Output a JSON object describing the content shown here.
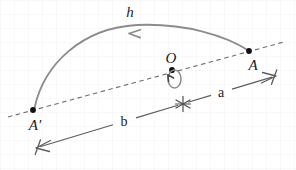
{
  "figure": {
    "type": "geometry-diagram",
    "title": "",
    "background_color": "#ffffff",
    "grid": {
      "visible": true,
      "color": "#f2f3f5",
      "spacing_px": 14
    },
    "colors": {
      "curve": "#8a8a8a",
      "dashed_axis": "#6e6e6e",
      "measure_line": "#5d5d5d",
      "point": "#111111",
      "label": "#1c1c1c",
      "loop_arrow": "#7f7f7f"
    },
    "labels": {
      "h": "h",
      "O": "O",
      "A": "A",
      "A_prime": "A'",
      "a": "a",
      "b": "b"
    },
    "points": [
      {
        "name": "A",
        "label": "A",
        "x": 249,
        "y": 51
      },
      {
        "name": "A-prime",
        "label": "A'",
        "x": 33,
        "y": 110
      },
      {
        "name": "O",
        "label": "O",
        "x": 172,
        "y": 70
      }
    ],
    "curve": {
      "name": "trajectory-h",
      "label": "h",
      "from": "A-prime",
      "to": "A",
      "direction_arrow": "toward-A-prime",
      "apex_x": 140,
      "apex_y": 28
    },
    "axis": {
      "name": "dashed-axis",
      "style": "dashed",
      "from_x": 8,
      "from_y": 117,
      "to_x": 284,
      "to_y": 42
    },
    "measure": {
      "name": "baseline-measure",
      "style": "double-headed-arrow",
      "from_x": 36,
      "from_y": 148,
      "to_x": 276,
      "to_y": 76,
      "midpoint_marker": "asterisk",
      "segments": [
        {
          "name": "segment-b",
          "label": "b",
          "side": "left"
        },
        {
          "name": "segment-a",
          "label": "a",
          "side": "right"
        }
      ]
    },
    "rotation_marker": {
      "name": "rotation-loop-arrow",
      "at_point": "O",
      "shape": "ellipse-loop",
      "arrow": "counterclockwise"
    }
  }
}
